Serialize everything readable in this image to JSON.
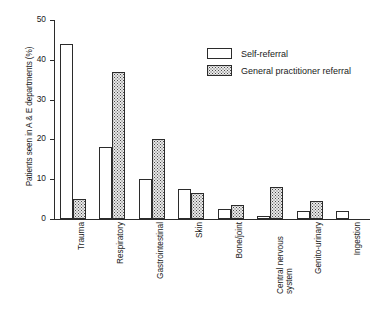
{
  "chart_data": {
    "type": "bar",
    "title": "",
    "xlabel": "",
    "ylabel": "Patients seen in A & E departments (%)",
    "ylim": [
      0,
      50
    ],
    "yticks": [
      0,
      10,
      20,
      30,
      40,
      50
    ],
    "grid": false,
    "legend_position": "top-right",
    "categories": [
      "Trauma",
      "Respiratory",
      "Gastrointestinal",
      "Skin",
      "Bone/joint",
      "Central nervous system",
      "Genito-urinary",
      "Ingestion"
    ],
    "series": [
      {
        "name": "Self-referral",
        "values": [
          44,
          18,
          10,
          7.5,
          2.5,
          0.8,
          2,
          2
        ]
      },
      {
        "name": "General practitioner referral",
        "values": [
          5,
          37,
          20,
          6.5,
          3.5,
          8,
          4.5,
          0
        ]
      }
    ]
  },
  "legend": {
    "items": [
      {
        "label": "Self-referral",
        "swatch": "open-box"
      },
      {
        "label": "General practitioner referral",
        "swatch": "stippled-box"
      }
    ]
  },
  "axes": {
    "y_title": "Patients seen in A & E departments (%)",
    "y_tick_labels": [
      "0",
      "10",
      "20",
      "30",
      "40",
      "50"
    ]
  }
}
